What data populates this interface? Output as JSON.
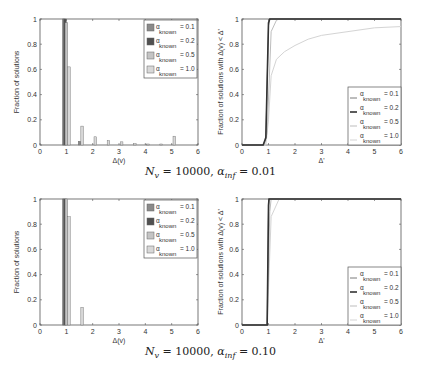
{
  "captions": [
    {
      "text": "N_v = 10000, α_inf = 0.01",
      "n_label": "N",
      "n_sub": "v",
      "n_val": "= 10000,",
      "a_label": "α",
      "a_sub": "inf",
      "a_val": "= 0.01"
    },
    {
      "text": "N_v = 10000, α_inf = 0.10",
      "n_label": "N",
      "n_sub": "v",
      "n_val": "= 10000,",
      "a_label": "α",
      "a_sub": "inf",
      "a_val": "= 0.10"
    }
  ],
  "legend": {
    "labels": [
      "α known = 0.1",
      "α known = 0.2",
      "α known = 0.5",
      "α known = 1.0"
    ],
    "values": [
      "= 0.1",
      "= 0.2",
      "= 0.5",
      "= 1.0"
    ],
    "alpha": "α",
    "sub": "known"
  },
  "colors": {
    "s01": "#8a8a8a",
    "s02": "#505050",
    "s05": "#c4c4c4",
    "s10": "#d8d8d8",
    "axis": "#555555"
  },
  "chart_data": [
    {
      "type": "bar",
      "title": "",
      "xlabel": "Δ(v)",
      "ylabel": "Fraction of solutions",
      "xlim": [
        0,
        6
      ],
      "ylim": [
        0,
        1
      ],
      "xticks": [
        "0",
        "1",
        "2",
        "3",
        "4",
        "5",
        "6"
      ],
      "yticks": [
        "0",
        "0.2",
        "0.4",
        "0.6",
        "0.8",
        "1"
      ],
      "legend_position": "upper right",
      "series": [
        {
          "name": "α_known = 0.1",
          "x": [
            0.9,
            1.5
          ],
          "values": [
            1.0,
            0.03
          ]
        },
        {
          "name": "α_known = 0.2",
          "x": [
            0.95
          ],
          "values": [
            1.0
          ]
        },
        {
          "name": "α_known = 0.5",
          "x": [
            1.0
          ],
          "values": [
            0.97
          ]
        },
        {
          "name": "α_known = 1.0",
          "x": [
            1.1,
            1.6,
            2.1,
            2.6,
            3.1,
            3.6,
            4.1,
            4.6,
            5.1
          ],
          "values": [
            0.62,
            0.15,
            0.065,
            0.035,
            0.025,
            0.01,
            0.008,
            0.008,
            0.07
          ]
        }
      ]
    },
    {
      "type": "line",
      "title": "",
      "xlabel": "Δ'",
      "ylabel": "Fraction of solutions with Δ(v) < Δ'",
      "xlim": [
        0,
        6
      ],
      "ylim": [
        0,
        1
      ],
      "xticks": [
        "0",
        "1",
        "2",
        "3",
        "4",
        "5",
        "6"
      ],
      "yticks": [
        "0",
        "0.2",
        "0.4",
        "0.6",
        "0.8",
        "1"
      ],
      "legend_position": "lower right",
      "series": [
        {
          "name": "α_known = 0.1",
          "x": [
            0,
            0.8,
            0.9,
            1.0,
            1.05,
            6
          ],
          "values": [
            0,
            0,
            0.05,
            0.95,
            1,
            1
          ]
        },
        {
          "name": "α_known = 0.2",
          "x": [
            0,
            0.8,
            0.9,
            1.0,
            1.05,
            6
          ],
          "values": [
            0,
            0,
            0.06,
            0.97,
            1,
            1
          ]
        },
        {
          "name": "α_known = 0.5",
          "x": [
            0,
            0.85,
            0.95,
            1.1,
            1.3,
            1.4,
            6
          ],
          "values": [
            0,
            0,
            0.1,
            0.9,
            0.99,
            1,
            1
          ]
        },
        {
          "name": "α_known = 1.0",
          "x": [
            0,
            0.9,
            1.0,
            1.1,
            1.3,
            1.6,
            2.0,
            2.5,
            3,
            4,
            5,
            6
          ],
          "values": [
            0,
            0,
            0.2,
            0.55,
            0.68,
            0.74,
            0.79,
            0.84,
            0.87,
            0.9,
            0.93,
            0.94
          ]
        }
      ]
    },
    {
      "type": "bar",
      "title": "",
      "xlabel": "Δ(v)",
      "ylabel": "Fraction of solutions",
      "xlim": [
        0,
        6
      ],
      "ylim": [
        0,
        1
      ],
      "xticks": [
        "0",
        "1",
        "2",
        "3",
        "4",
        "5",
        "6"
      ],
      "yticks": [
        "0",
        "0.2",
        "0.4",
        "0.6",
        "0.8",
        "1"
      ],
      "legend_position": "upper right",
      "series": [
        {
          "name": "α_known = 0.1",
          "x": [
            0.9
          ],
          "values": [
            1.0
          ]
        },
        {
          "name": "α_known = 0.2",
          "x": [
            0.95
          ],
          "values": [
            1.0
          ]
        },
        {
          "name": "α_known = 0.5",
          "x": [
            1.0
          ],
          "values": [
            1.0
          ]
        },
        {
          "name": "α_known = 1.0",
          "x": [
            1.1,
            1.6
          ],
          "values": [
            0.86,
            0.14
          ]
        }
      ]
    },
    {
      "type": "line",
      "title": "",
      "xlabel": "Δ'",
      "ylabel": "Fraction of solutions with Δ(v) < Δ'",
      "xlim": [
        0,
        6
      ],
      "ylim": [
        0,
        1
      ],
      "xticks": [
        "0",
        "1",
        "2",
        "3",
        "4",
        "5",
        "6"
      ],
      "yticks": [
        "0",
        "0.2",
        "0.4",
        "0.6",
        "0.8",
        "1"
      ],
      "legend_position": "lower right",
      "series": [
        {
          "name": "α_known = 0.1",
          "x": [
            0,
            0.95,
            1.0,
            1.02,
            6
          ],
          "values": [
            0,
            0,
            0.9,
            1,
            1
          ]
        },
        {
          "name": "α_known = 0.2",
          "x": [
            0,
            0.95,
            1.0,
            1.02,
            6
          ],
          "values": [
            0,
            0,
            0.95,
            1,
            1
          ]
        },
        {
          "name": "α_known = 0.5",
          "x": [
            0,
            0.95,
            1.05,
            1.1,
            6
          ],
          "values": [
            0,
            0,
            0.9,
            1,
            1
          ]
        },
        {
          "name": "α_known = 1.0",
          "x": [
            0,
            0.95,
            1.1,
            1.4,
            6
          ],
          "values": [
            0,
            0,
            0.86,
            1,
            1
          ]
        }
      ]
    }
  ]
}
